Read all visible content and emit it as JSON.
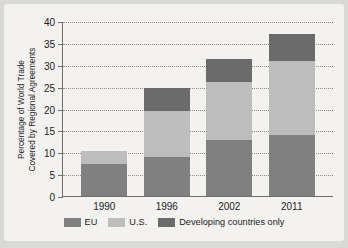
{
  "chart_data": {
    "type": "bar",
    "stacked": true,
    "title": "",
    "xlabel": "",
    "ylabel": "Percentage of World Trade\nCovered by Regional Agreements",
    "categories": [
      "1990",
      "1996",
      "2002",
      "2011"
    ],
    "yticks": [
      0,
      5,
      10,
      15,
      20,
      25,
      30,
      35,
      40
    ],
    "ylim": [
      0,
      40
    ],
    "grid": true,
    "legend_position": "bottom",
    "series": [
      {
        "name": "EU",
        "color": "#808080",
        "values": [
          7.3,
          9.0,
          12.9,
          13.9
        ]
      },
      {
        "name": "U.S.",
        "color": "#bdbdbd",
        "values": [
          3.0,
          10.5,
          13.2,
          16.9
        ]
      },
      {
        "name": "Developing countries only",
        "color": "#6b6b6b",
        "values": [
          0.0,
          5.3,
          5.2,
          6.2
        ]
      }
    ],
    "totals": [
      10.3,
      24.8,
      31.3,
      37.0
    ]
  },
  "legend": {
    "items": [
      {
        "label": "EU"
      },
      {
        "label": "U.S."
      },
      {
        "label": "Developing countries only"
      }
    ]
  },
  "colors": {
    "page_background": "#d9d9d7",
    "card_background": "#f3f2ef",
    "axis": "#6f6f6f",
    "grid": "#8d8d8d",
    "text": "#1d1d1d"
  }
}
